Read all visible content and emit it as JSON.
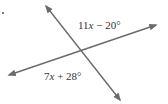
{
  "figure": {
    "type": "intersecting-lines",
    "line_color": "#6b6b6b",
    "lines": [
      {
        "name": "line-a",
        "from": [
          9,
          75
        ],
        "to": [
          156,
          25
        ],
        "arrows": "both"
      },
      {
        "name": "line-b",
        "from": [
          46,
          6
        ],
        "to": [
          120,
          100
        ],
        "arrows": "both"
      }
    ],
    "intersection": [
      81,
      52
    ],
    "angles": {
      "top": {
        "coef": "11",
        "var": "x",
        "op": " − ",
        "const": "20°"
      },
      "bottom": {
        "coef": "7",
        "var": "x",
        "op": " + ",
        "const": "28°"
      }
    }
  }
}
